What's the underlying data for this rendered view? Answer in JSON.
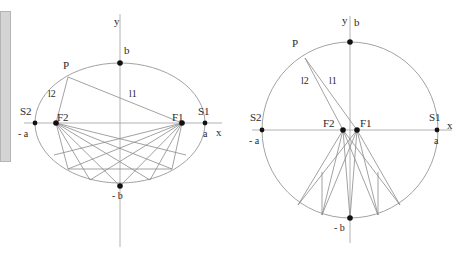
{
  "figure": {
    "stroke_color": "#808080",
    "axis_color": "#999999",
    "point_color": "#111111",
    "label_color": "#2a2a2a",
    "background": "#ffffff",
    "scrollbar": {
      "color": "#d4d4d4",
      "border": "#b4b4b4"
    }
  },
  "left_figure": {
    "name": "ellipse-diagram",
    "shape": "ellipse",
    "center": {
      "x": 120,
      "y": 123
    },
    "semi_major_a": 85,
    "semi_minor_b": 60,
    "labels": {
      "y_axis": "y",
      "x_axis": "x",
      "top_vertex": "b",
      "bottom_vertex": "- b",
      "left_vertex": "- a",
      "right_vertex": "a",
      "left_point": "S2",
      "right_point": "S1",
      "left_focus": "F2",
      "right_focus": "F1",
      "moving_point": "P",
      "focal_radius_1": "l1",
      "focal_radius_2": "l2"
    },
    "points": {
      "S2": {
        "x": 35,
        "y": 123
      },
      "S1": {
        "x": 205,
        "y": 123
      },
      "F2": {
        "x": 56,
        "y": 123
      },
      "F1": {
        "x": 182,
        "y": 123
      },
      "b": {
        "x": 120,
        "y": 63
      },
      "minus_b": {
        "x": 120,
        "y": 186
      },
      "P": {
        "x": 68,
        "y": 77
      }
    }
  },
  "right_figure": {
    "name": "circle-diagram",
    "shape": "circle",
    "center": {
      "x": 350,
      "y": 130
    },
    "radius": 88,
    "labels": {
      "y_axis": "y",
      "x_axis": "x",
      "top_vertex": "b",
      "bottom_vertex": "- b",
      "left_vertex": "- a",
      "right_vertex": "a",
      "left_point": "S2",
      "right_point": "S1",
      "left_focus": "F2",
      "right_focus": "F1",
      "moving_point": "P",
      "focal_radius_1": "l1",
      "focal_radius_2": "l2"
    },
    "points": {
      "S2": {
        "x": 262,
        "y": 130
      },
      "S1": {
        "x": 437,
        "y": 130
      },
      "F2": {
        "x": 343,
        "y": 130
      },
      "F1": {
        "x": 357,
        "y": 130
      },
      "b": {
        "x": 350,
        "y": 42
      },
      "minus_b": {
        "x": 350,
        "y": 218
      },
      "P": {
        "x": 305,
        "y": 58
      }
    }
  }
}
